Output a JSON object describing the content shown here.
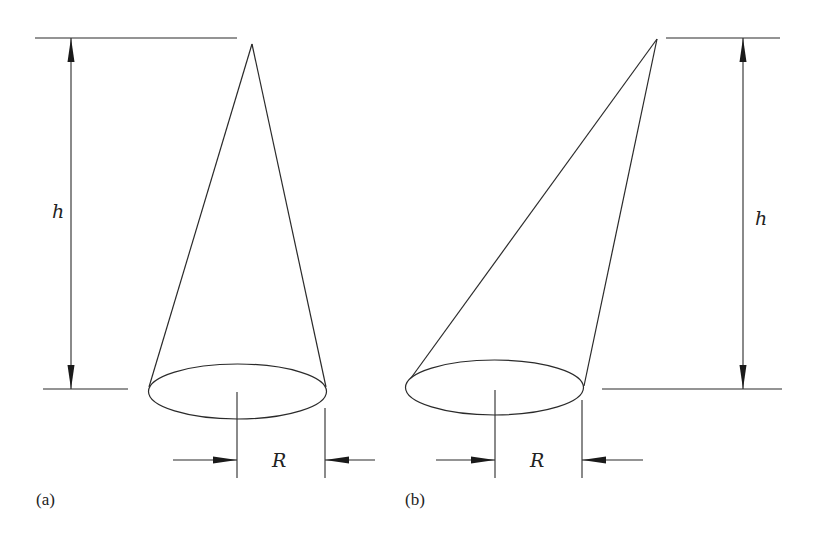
{
  "figure": {
    "panels": [
      {
        "id": "a",
        "label": "(a)",
        "description": "Right circular cone",
        "height_label": "h",
        "radius_label": "R"
      },
      {
        "id": "b",
        "label": "(b)",
        "description": "Oblique cone",
        "height_label": "h",
        "radius_label": "R"
      }
    ],
    "colors": {
      "line": "#2a2a2a",
      "background": "#ffffff"
    }
  }
}
